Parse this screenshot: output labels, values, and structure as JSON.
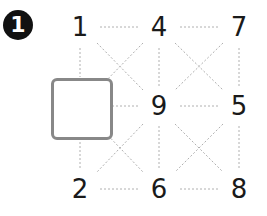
{
  "badge": {
    "label": "1"
  },
  "grid": {
    "cells": [
      {
        "row": 0,
        "col": 0,
        "value": "1"
      },
      {
        "row": 0,
        "col": 1,
        "value": "4"
      },
      {
        "row": 0,
        "col": 2,
        "value": "7"
      },
      {
        "row": 1,
        "col": 0,
        "value": ""
      },
      {
        "row": 1,
        "col": 1,
        "value": "9"
      },
      {
        "row": 1,
        "col": 2,
        "value": "5"
      },
      {
        "row": 2,
        "col": 0,
        "value": "2"
      },
      {
        "row": 2,
        "col": 1,
        "value": "6"
      },
      {
        "row": 2,
        "col": 2,
        "value": "8"
      }
    ],
    "empty_cell": {
      "row": 1,
      "col": 0
    },
    "line_color": "#b0b0b0",
    "box_color": "#888888"
  }
}
